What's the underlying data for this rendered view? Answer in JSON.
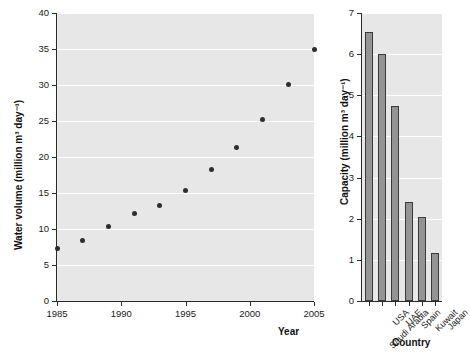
{
  "chart_data": [
    {
      "type": "scatter",
      "name": "global-desalinated-water-volume",
      "title": "",
      "xlabel": "Year",
      "ylabel": "Water volume (million m³ day⁻¹)",
      "xlim": [
        1985,
        2005
      ],
      "ylim": [
        0,
        40
      ],
      "xticks": [
        1985,
        1990,
        1995,
        2000,
        2005
      ],
      "xticklabels": [
        "1985",
        "1990",
        "1995",
        "2000",
        "2005"
      ],
      "yticks": [
        0,
        5,
        10,
        15,
        20,
        25,
        30,
        35,
        40
      ],
      "yticklabels": [
        "0",
        "5",
        "10",
        "15",
        "20",
        "25",
        "30",
        "35",
        "40"
      ],
      "grid": "horizontal",
      "legend": "none",
      "marker_color": "#2e2e2e",
      "plot_background": "#e7e7e7",
      "x": [
        1985,
        1987,
        1989,
        1991,
        1993,
        1995,
        1997,
        1999,
        2001,
        2003,
        2005
      ],
      "y": [
        7.3,
        8.4,
        10.3,
        12.2,
        13.2,
        15.3,
        18.2,
        21.3,
        25.2,
        30.1,
        35.0
      ]
    },
    {
      "type": "bar",
      "name": "desalination-capacity-by-country",
      "title": "",
      "xlabel": "Country",
      "ylabel": "Capacity (million m³ day⁻¹)",
      "ylim": [
        0,
        7
      ],
      "yticks": [
        0,
        1,
        2,
        3,
        4,
        5,
        6,
        7
      ],
      "yticklabels": [
        "0",
        "1",
        "2",
        "3",
        "4",
        "5",
        "6",
        "7"
      ],
      "grid": "horizontal",
      "legend": "none",
      "bar_color": "#949494",
      "bar_edge_color": "#3a3a3a",
      "plot_background": "#e7e7e7",
      "categories": [
        "Saudi Arabia",
        "USA",
        "UAE",
        "Spain",
        "Kuwait",
        "Japan"
      ],
      "values": [
        6.55,
        6.0,
        4.75,
        2.4,
        2.05,
        1.17
      ]
    }
  ]
}
